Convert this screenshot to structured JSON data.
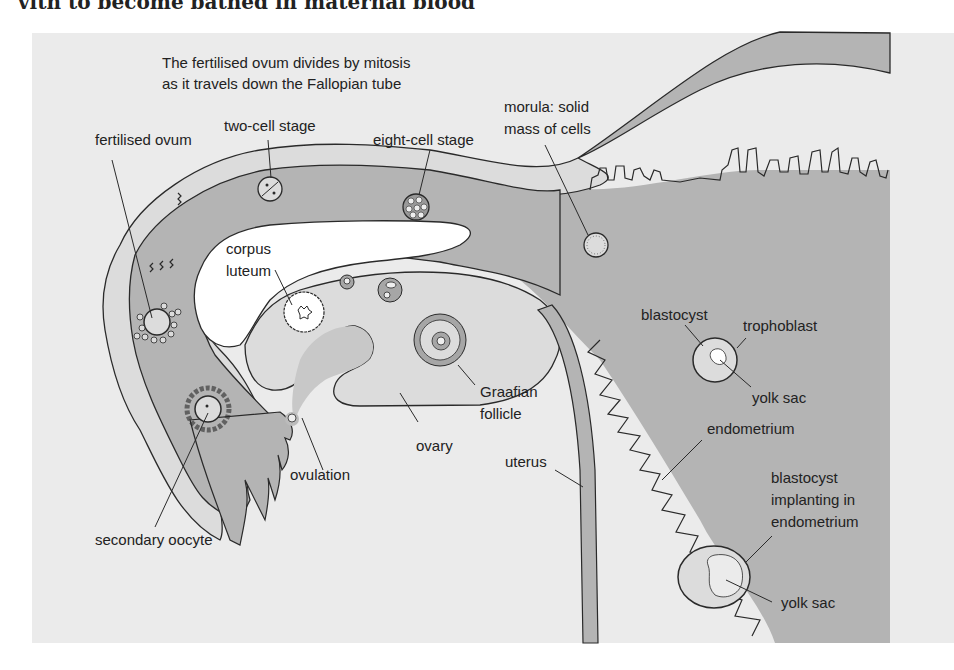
{
  "page": {
    "top_text_partial": "vith to become bathed in maternal blood"
  },
  "diagram": {
    "caption": {
      "line1": "The fertilised ovum divides by mitosis",
      "line2": "as it travels down the Fallopian tube"
    },
    "labels": {
      "fertilised_ovum": "fertilised ovum",
      "two_cell": "two-cell stage",
      "eight_cell": "eight-cell stage",
      "morula_1": "morula: solid",
      "morula_2": "mass of cells",
      "corpus_1": "corpus",
      "corpus_2": "luteum",
      "graafian_1": "Graafian",
      "graafian_2": "follicle",
      "ovary": "ovary",
      "ovulation": "ovulation",
      "secondary_oocyte": "secondary oocyte",
      "uterus": "uterus",
      "blastocyst": "blastocyst",
      "trophoblast": "trophoblast",
      "yolk_sac_1": "yolk sac",
      "endometrium": "endometrium",
      "implant_1": "blastocyst",
      "implant_2": "implanting in",
      "implant_3": "endometrium",
      "yolk_sac_2": "yolk sac"
    },
    "colors": {
      "background": "#ebebeb",
      "tissue_fill": "#b4b4b4",
      "light_fill": "#dcdcdc",
      "white": "#ffffff",
      "outline": "#2a2a2a"
    }
  }
}
